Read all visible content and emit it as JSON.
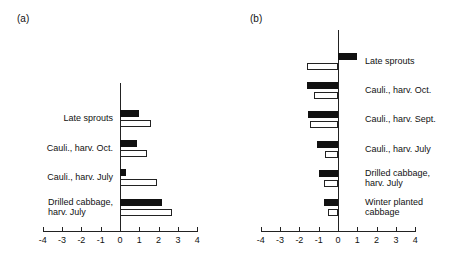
{
  "chart_data": [
    {
      "type": "bar",
      "orientation": "horizontal",
      "panel": "(a)",
      "title": "",
      "xlabel": "",
      "ylabel": "",
      "xlim": [
        -4,
        4
      ],
      "xticks": [
        "-4",
        "-3",
        "-2",
        "-1",
        "0",
        "1",
        "2",
        "3",
        "4"
      ],
      "grid": false,
      "legend": null,
      "categories": [
        "Late sprouts",
        "Cauli., harv. Oct.",
        "Cauli., harv. July",
        "Drilled cabbage,\nharv. July"
      ],
      "series": [
        {
          "name": "solid",
          "color": "#111111",
          "values": [
            1.0,
            0.9,
            0.3,
            2.2
          ]
        },
        {
          "name": "open",
          "color": "#ffffff",
          "values": [
            1.6,
            1.4,
            1.9,
            2.7
          ]
        }
      ]
    },
    {
      "type": "bar",
      "orientation": "horizontal",
      "panel": "(b)",
      "title": "",
      "xlabel": "",
      "ylabel": "",
      "xlim": [
        -4,
        4
      ],
      "xticks": [
        "-4",
        "-3",
        "-2",
        "-1",
        "0",
        "1",
        "2",
        "3",
        "4"
      ],
      "grid": false,
      "legend": null,
      "categories": [
        "Late sprouts",
        "Cauli., harv. Oct.",
        "Cauli., harv. Sept.",
        "Cauli., harv. July",
        "Drilled cabbage,\nharv. July",
        "Winter planted\ncabbage"
      ],
      "series": [
        {
          "name": "solid",
          "color": "#111111",
          "values": [
            1.0,
            -1.6,
            -1.55,
            -1.1,
            -1.0,
            -0.75
          ]
        },
        {
          "name": "open",
          "color": "#ffffff",
          "values": [
            -1.6,
            -1.25,
            -1.45,
            -0.65,
            -0.7,
            -0.5
          ]
        }
      ]
    }
  ]
}
